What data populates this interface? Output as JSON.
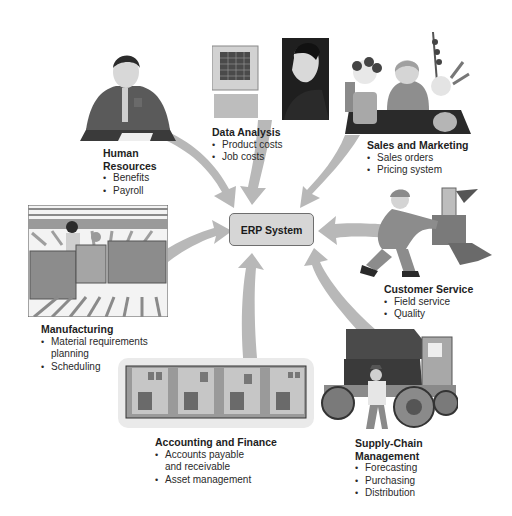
{
  "center": {
    "label": "ERP System"
  },
  "modules": [
    {
      "id": "human-resources",
      "title_lines": [
        "Human",
        "Resources"
      ],
      "items": [
        "Benefits",
        "Payroll"
      ],
      "icon": "person-writing-at-desk"
    },
    {
      "id": "data-analysis",
      "title_lines": [
        "Data Analysis"
      ],
      "items": [
        "Product costs",
        "Job costs"
      ],
      "icon": "person-at-computer"
    },
    {
      "id": "sales-and-marketing",
      "title_lines": [
        "Sales and Marketing"
      ],
      "items": [
        "Sales orders",
        "Pricing system"
      ],
      "icon": "florist-with-flowers"
    },
    {
      "id": "customer-service",
      "title_lines": [
        "Customer Service"
      ],
      "items": [
        "Field service",
        "Quality"
      ],
      "icon": "technician-repairing-machine"
    },
    {
      "id": "supply-chain-management",
      "title_lines": [
        "Supply-Chain",
        "Management"
      ],
      "items": [
        "Forecasting",
        "Purchasing",
        "Distribution"
      ],
      "icon": "truck-with-worker"
    },
    {
      "id": "accounting-and-finance",
      "title_lines": [
        "Accounting and Finance"
      ],
      "items": [
        "Accounts payable and receivable",
        "Asset management"
      ],
      "items_display": [
        [
          "Accounts payable",
          "and receivable"
        ],
        [
          "Asset management"
        ]
      ],
      "icon": "office-cubicles"
    },
    {
      "id": "manufacturing",
      "title_lines": [
        "Manufacturing"
      ],
      "items": [
        "Material requirements planning",
        "Scheduling"
      ],
      "items_display": [
        [
          "Material requirements",
          "planning"
        ],
        [
          "Scheduling"
        ]
      ],
      "icon": "factory-floor-workers"
    }
  ],
  "colors": {
    "arrow": "#b5b5b5",
    "erp_box": "#d6d6d6",
    "erp_border": "#6e6e6e",
    "text": "#222222"
  }
}
